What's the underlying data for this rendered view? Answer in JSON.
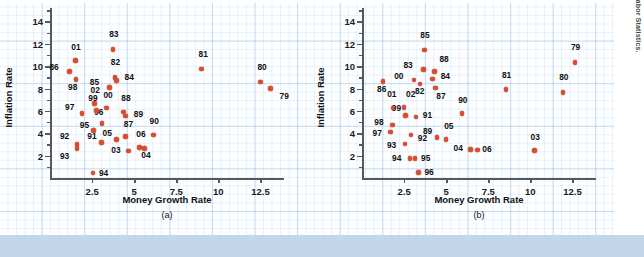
{
  "figure": {
    "source_note": "SOURCE: Federal Reserve System and Bureau of Labor Statistics.",
    "marker_color": "#e04a2a",
    "grid_color": "#bad6ee",
    "background": "#fdfeff"
  },
  "chart_data": [
    {
      "type": "scatter",
      "panel": "a",
      "title": "",
      "caption": "(a)",
      "xlabel": "Money Growth Rate",
      "ylabel": "Inflation Rate",
      "xlim": [
        0,
        13.9
      ],
      "ylim": [
        0,
        15.2
      ],
      "xticks": [
        2.5,
        5,
        7.5,
        10,
        12.5
      ],
      "xticklabels": [
        "2.5",
        "5",
        "7.5",
        "10",
        "12.5"
      ],
      "yticks": [
        2,
        4,
        6,
        8,
        10,
        12,
        14
      ],
      "yticklabels": [
        "2",
        "4",
        "6",
        "8",
        "10",
        "12",
        "14"
      ],
      "grid": true,
      "legend": "none",
      "points": [
        {
          "label": "79",
          "x": 13.1,
          "y": 8.0,
          "lx": 9,
          "ly": 7
        },
        {
          "label": "80",
          "x": 12.5,
          "y": 8.6,
          "lx": -3,
          "ly": -15
        },
        {
          "label": "81",
          "x": 9.0,
          "y": 9.75,
          "lx": -3,
          "ly": -15
        },
        {
          "label": "82",
          "x": 3.85,
          "y": 9.0,
          "lx": -4,
          "ly": -15
        },
        {
          "label": "83",
          "x": 3.75,
          "y": 11.5,
          "lx": -4,
          "ly": -15
        },
        {
          "label": "84",
          "x": 3.95,
          "y": 8.7,
          "lx": 8,
          "ly": -4
        },
        {
          "label": "85",
          "x": 3.55,
          "y": 8.1,
          "lx": -20,
          "ly": -5
        },
        {
          "label": "86",
          "x": 1.15,
          "y": 9.5,
          "lx": -20,
          "ly": -5
        },
        {
          "label": "87",
          "x": 4.5,
          "y": 3.7,
          "lx": -2,
          "ly": -13
        },
        {
          "label": "88",
          "x": 4.35,
          "y": 5.9,
          "lx": -2,
          "ly": -14
        },
        {
          "label": "89",
          "x": 4.5,
          "y": 5.55,
          "lx": 8,
          "ly": -2
        },
        {
          "label": "90",
          "x": 6.15,
          "y": 3.85,
          "lx": -4,
          "ly": -14
        },
        {
          "label": "91",
          "x": 3.05,
          "y": 3.2,
          "lx": -14,
          "ly": -6
        },
        {
          "label": "92",
          "x": 1.6,
          "y": 3.0,
          "lx": -17,
          "ly": -8
        },
        {
          "label": "93",
          "x": 1.6,
          "y": 2.65,
          "lx": -17,
          "ly": 8
        },
        {
          "label": "94",
          "x": 2.55,
          "y": 0.45,
          "lx": 6,
          "ly": 0
        },
        {
          "label": "95",
          "x": 2.6,
          "y": 4.25,
          "lx": -14,
          "ly": -5
        },
        {
          "label": "96",
          "x": 3.1,
          "y": 4.85,
          "lx": -8,
          "ly": -12
        },
        {
          "label": "97",
          "x": 1.9,
          "y": 5.75,
          "lx": -17,
          "ly": -7
        },
        {
          "label": "98",
          "x": 1.55,
          "y": 8.8,
          "lx": -8,
          "ly": 7
        },
        {
          "label": "99",
          "x": 2.75,
          "y": 6.05,
          "lx": -8,
          "ly": -12
        },
        {
          "label": "00",
          "x": 3.35,
          "y": 6.25,
          "lx": -3,
          "ly": -13
        },
        {
          "label": "01",
          "x": 1.5,
          "y": 10.5,
          "lx": -4,
          "ly": -14
        },
        {
          "label": "02",
          "x": 2.65,
          "y": 6.65,
          "lx": -4,
          "ly": -14
        },
        {
          "label": "03",
          "x": 4.65,
          "y": 2.4,
          "lx": -17,
          "ly": -1
        },
        {
          "label": "04",
          "x": 5.6,
          "y": 2.65,
          "lx": -3,
          "ly": 7
        },
        {
          "label": "05",
          "x": 3.95,
          "y": 3.45,
          "lx": -14,
          "ly": -6
        },
        {
          "label": "06",
          "x": 5.3,
          "y": 2.75,
          "lx": -3,
          "ly": -13
        }
      ]
    },
    {
      "type": "scatter",
      "panel": "b",
      "title": "",
      "caption": "(b)",
      "xlabel": "Money Growth Rate",
      "ylabel": "Inflation Rate",
      "xlim": [
        0,
        13.9
      ],
      "ylim": [
        0,
        15.2
      ],
      "xticks": [
        2.5,
        5,
        7.5,
        10,
        12.5
      ],
      "xticklabels": [
        "2.5",
        "5",
        "7.5",
        "10",
        "12.5"
      ],
      "yticks": [
        2,
        4,
        6,
        8,
        10,
        12,
        14
      ],
      "yticklabels": [
        "2",
        "4",
        "6",
        "8",
        "10",
        "12",
        "14"
      ],
      "grid": true,
      "legend": "none",
      "points": [
        {
          "label": "79",
          "x": 12.65,
          "y": 10.35,
          "lx": -4,
          "ly": -15
        },
        {
          "label": "80",
          "x": 11.95,
          "y": 7.65,
          "lx": -4,
          "ly": -15
        },
        {
          "label": "81",
          "x": 8.55,
          "y": 7.9,
          "lx": -4,
          "ly": -15
        },
        {
          "label": "82",
          "x": 3.45,
          "y": 8.4,
          "lx": -5,
          "ly": 7
        },
        {
          "label": "83",
          "x": 3.65,
          "y": 9.7,
          "lx": -20,
          "ly": -5
        },
        {
          "label": "84",
          "x": 4.2,
          "y": 8.85,
          "lx": 8,
          "ly": -3
        },
        {
          "label": "85",
          "x": 3.7,
          "y": 11.45,
          "lx": -4,
          "ly": -15
        },
        {
          "label": "86",
          "x": 1.25,
          "y": 8.65,
          "lx": -6,
          "ly": 8
        },
        {
          "label": "87",
          "x": 4.35,
          "y": 8.05,
          "lx": 1,
          "ly": 8
        },
        {
          "label": "88",
          "x": 4.3,
          "y": 9.5,
          "lx": 5,
          "ly": -13
        },
        {
          "label": "89",
          "x": 4.45,
          "y": 3.6,
          "lx": -14,
          "ly": -7
        },
        {
          "label": "90",
          "x": 5.95,
          "y": 5.75,
          "lx": -4,
          "ly": -14
        },
        {
          "label": "91",
          "x": 3.2,
          "y": 5.45,
          "lx": 7,
          "ly": -2
        },
        {
          "label": "92",
          "x": 2.9,
          "y": 3.85,
          "lx": 7,
          "ly": 3
        },
        {
          "label": "93",
          "x": 2.55,
          "y": 3.05,
          "lx": -18,
          "ly": 1
        },
        {
          "label": "94",
          "x": 2.85,
          "y": 1.75,
          "lx": -18,
          "ly": 0
        },
        {
          "label": "95",
          "x": 3.15,
          "y": 1.75,
          "lx": 6,
          "ly": 0
        },
        {
          "label": "96",
          "x": 3.35,
          "y": 0.5,
          "lx": 6,
          "ly": 0
        },
        {
          "label": "97",
          "x": 1.7,
          "y": 4.1,
          "lx": -18,
          "ly": 1
        },
        {
          "label": "98",
          "x": 1.8,
          "y": 4.75,
          "lx": -18,
          "ly": -3
        },
        {
          "label": "99",
          "x": 2.6,
          "y": 5.6,
          "lx": -14,
          "ly": -7
        },
        {
          "label": "00",
          "x": 3.1,
          "y": 8.75,
          "lx": -20,
          "ly": -4
        },
        {
          "label": "01",
          "x": 1.85,
          "y": 6.25,
          "lx": -6,
          "ly": -14
        },
        {
          "label": "02",
          "x": 2.5,
          "y": 6.3,
          "lx": 2,
          "ly": -14
        },
        {
          "label": "03",
          "x": 10.25,
          "y": 2.45,
          "lx": -4,
          "ly": -14
        },
        {
          "label": "04",
          "x": 6.45,
          "y": 2.55,
          "lx": -17,
          "ly": -1
        },
        {
          "label": "05",
          "x": 5.0,
          "y": 3.45,
          "lx": -2,
          "ly": -13
        },
        {
          "label": "06",
          "x": 6.85,
          "y": 2.5,
          "lx": 5,
          "ly": -1
        }
      ]
    }
  ]
}
